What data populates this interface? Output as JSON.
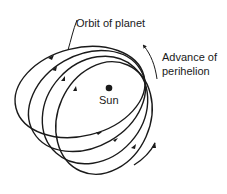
{
  "diagram": {
    "labels": {
      "orbit": "Orbit of planet",
      "sun": "Sun",
      "advance_line1": "Advance of",
      "advance_line2": "perihelion"
    },
    "elements": {
      "central_body": "sun-dot",
      "orbits_count": 4,
      "orbit_direction": "counterclockwise",
      "advance_arrow_direction": "counterclockwise"
    },
    "colors": {
      "stroke": "#1a1a1a",
      "background": "#ffffff"
    }
  }
}
